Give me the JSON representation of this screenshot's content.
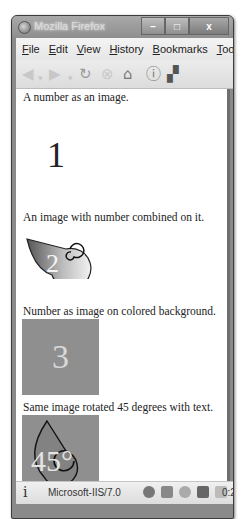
{
  "window": {
    "title": "Mozilla Firefox",
    "controls": {
      "minimize": "–",
      "maximize": "□",
      "close": "x"
    }
  },
  "menubar": {
    "items": [
      "File",
      "Edit",
      "View",
      "History",
      "Bookmarks",
      "Tools"
    ]
  },
  "navbar": {
    "icons": [
      "back-icon",
      "forward-icon",
      "reload-icon",
      "stop-icon",
      "home-icon",
      "info-icon",
      "addon-icon"
    ]
  },
  "content": {
    "caption1": "A number as an image.",
    "number1": "1",
    "caption2": "An image with number combined on it.",
    "number2": "2",
    "caption3": "Number as image on colored background.",
    "number3": "3",
    "caption4": "Same image rotated 45 degrees with text.",
    "number4": "45°",
    "colors": {
      "tile_background": "#8f8f8f",
      "tile_text": "#d9d9d9"
    }
  },
  "statusbar": {
    "info_glyph": "i",
    "server": "Microsoft-IIS/7.0",
    "time": "0:25"
  }
}
